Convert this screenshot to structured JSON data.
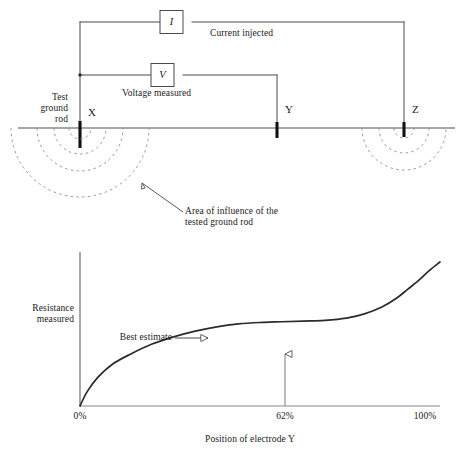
{
  "figure": {
    "type": "technical-diagram"
  },
  "top_diagram": {
    "meters": [
      {
        "id": "current-meter",
        "symbol": "I",
        "caption": "Current injected"
      },
      {
        "id": "voltage-meter",
        "symbol": "V",
        "caption": "Voltage measured"
      }
    ],
    "electrodes": [
      {
        "id": "x",
        "label": "X",
        "note": "Test\nground\nrod"
      },
      {
        "id": "y",
        "label": "Y",
        "note": ""
      },
      {
        "id": "z",
        "label": "Z",
        "note": ""
      }
    ],
    "test_rod_label": "Test\nground\nrod",
    "influence_annotation": "Area of influence of the\ntested ground rod"
  },
  "chart_data": {
    "type": "line",
    "title": "",
    "xlabel": "Position of electrode Y",
    "ylabel": "Resistance\nmeasured",
    "xlabel_lines": [
      "Position of electrode Y"
    ],
    "ylabel_lines": [
      "Resistance",
      "measured"
    ],
    "xticks": [
      "0%",
      "62%",
      "100%"
    ],
    "xtick_values": [
      0,
      62,
      100
    ],
    "yticks": [],
    "xlim": [
      0,
      100
    ],
    "ylim": [
      0,
      100
    ],
    "grid": false,
    "legend": false,
    "annotations": [
      {
        "id": "best-estimate",
        "text": "Best estimate",
        "points_to_x": 45,
        "points_to_y": 55
      },
      {
        "id": "sixty-two-marker",
        "text": "62%",
        "at_x": 62
      }
    ],
    "series": [
      {
        "name": "Resistance measured",
        "x": [
          0,
          2,
          5,
          9,
          14,
          20,
          26,
          32,
          38,
          44,
          50,
          56,
          62,
          68,
          74,
          79,
          84,
          88,
          91,
          94,
          97,
          100
        ],
        "values": [
          0,
          10,
          20,
          29,
          36,
          43,
          48,
          52,
          55,
          57,
          58,
          58.5,
          59,
          59.5,
          61,
          64,
          69,
          75,
          81,
          87,
          94,
          100
        ]
      }
    ]
  },
  "colors": {
    "ink": "#1a1a1a",
    "wire": "#4a4a4a",
    "ground_line": "#7a7a7a",
    "dashed_arc": "#8a8a8a",
    "axis": "#6f6f6f",
    "curve": "#2b2b2b",
    "background": "#ffffff"
  }
}
